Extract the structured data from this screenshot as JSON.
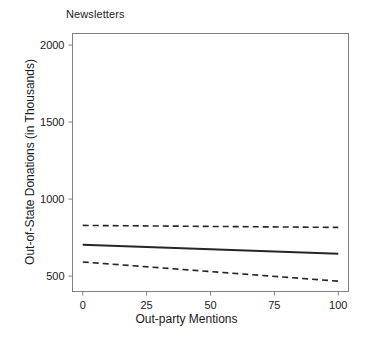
{
  "chart_data": {
    "type": "line",
    "title": "Newsletters",
    "xlabel": "Out-party Mentions",
    "ylabel": "Out-of-State Donations (in Thousands)",
    "xlim": [
      -4,
      104
    ],
    "ylim": [
      400,
      2075
    ],
    "grid": false,
    "legend": null,
    "xticks": [
      0,
      25,
      50,
      75,
      100
    ],
    "xtick_labels": [
      "0",
      "25",
      "50",
      "75",
      "100"
    ],
    "yticks": [
      500,
      1000,
      1500,
      2000
    ],
    "ytick_labels": [
      "500",
      "1000",
      "1500",
      "2000"
    ],
    "series": [
      {
        "name": "Predicted donations",
        "style": "solid",
        "color": "#262626",
        "width": 2.0,
        "x": [
          0,
          100
        ],
        "values": [
          704,
          645
        ]
      },
      {
        "name": "Upper confidence bound",
        "style": "dashed",
        "color": "#262626",
        "width": 1.6,
        "x": [
          0,
          100
        ],
        "values": [
          829,
          816
        ]
      },
      {
        "name": "Lower confidence bound",
        "style": "dashed",
        "color": "#262626",
        "width": 1.6,
        "x": [
          0,
          100
        ],
        "values": [
          592,
          467
        ]
      }
    ]
  },
  "axes": {
    "frame_color": "#808080",
    "tick_color": "#808080"
  }
}
